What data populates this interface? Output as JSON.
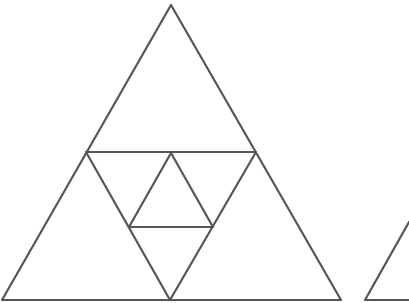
{
  "diagram": {
    "type": "nested-triangles",
    "colors": {
      "background": "#ffffff",
      "stroke": "#555555"
    },
    "stroke_width": 2.2,
    "shapes": [
      {
        "id": "outer-triangle",
        "points": [
          [
            171,
            5
          ],
          [
            341,
            300
          ],
          [
            2,
            300
          ]
        ]
      },
      {
        "id": "mid-triangle",
        "points": [
          [
            86,
            152
          ],
          [
            256,
            152
          ],
          [
            170,
            300
          ]
        ]
      },
      {
        "id": "inner-triangle",
        "points": [
          [
            171,
            153
          ],
          [
            213,
            227
          ],
          [
            129,
            227
          ]
        ]
      },
      {
        "id": "partial-right-triangle",
        "points": [
          [
            409,
            222
          ],
          [
            365,
            300
          ],
          [
            409,
            300
          ]
        ]
      }
    ]
  }
}
